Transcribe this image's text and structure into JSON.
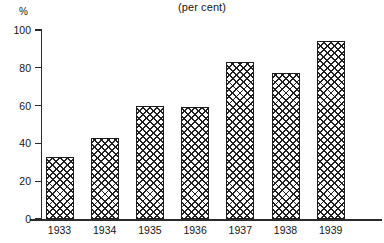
{
  "chart_data": {
    "type": "bar",
    "title": "(per cent)",
    "xlabel": "",
    "ylabel": "%",
    "categories": [
      "1933",
      "1934",
      "1935",
      "1936",
      "1937",
      "1938",
      "1939"
    ],
    "values": [
      33,
      43,
      60,
      59,
      83,
      77,
      94
    ],
    "ylim": [
      0,
      100
    ],
    "yticks": [
      0,
      20,
      40,
      60,
      80,
      100
    ],
    "ytick_labels": [
      "0",
      "20",
      "40",
      "60",
      "80",
      "100"
    ],
    "grid": false,
    "legend": "none",
    "series": [
      {
        "name": "per cent",
        "values": [
          33,
          43,
          60,
          59,
          83,
          77,
          94
        ]
      }
    ]
  },
  "style": {
    "bar_fill_pattern": "cross-hatch",
    "bar_outline_color": "#1c1c1c",
    "axis_color": "#2a2a2a",
    "text_color": "#141414",
    "background": "#ffffff"
  }
}
